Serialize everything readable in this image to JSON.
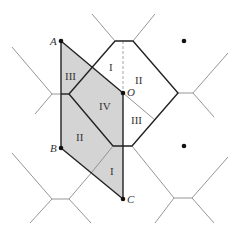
{
  "diagram": {
    "type": "voronoi-hexagonal-lattice-with-shaded-unit-cell",
    "points": {
      "A": {
        "label": "A",
        "x": 61,
        "y": 41
      },
      "B": {
        "label": "B",
        "x": 61,
        "y": 148
      },
      "C": {
        "label": "C",
        "x": 123,
        "y": 199
      },
      "O": {
        "label": "O",
        "x": 123,
        "y": 93
      }
    },
    "lattice_dots": [
      {
        "x": 184,
        "y": 41
      },
      {
        "x": 184,
        "y": 146
      }
    ],
    "region_labels": [
      {
        "text": "III",
        "x": 70,
        "y": 78
      },
      {
        "text": "I",
        "x": 108,
        "y": 69
      },
      {
        "text": "II",
        "x": 136,
        "y": 83
      },
      {
        "text": "IV",
        "x": 104,
        "y": 108
      },
      {
        "text": "III",
        "x": 134,
        "y": 122
      },
      {
        "text": "II",
        "x": 80,
        "y": 139
      },
      {
        "text": "I",
        "x": 110,
        "y": 174
      }
    ],
    "colors": {
      "shade": "#d4d4d4",
      "thin_line": "#8a8a8a",
      "thick_line": "#222222",
      "dashed_line": "#9a9a9a"
    }
  }
}
